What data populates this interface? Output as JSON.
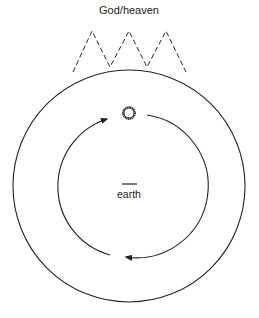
{
  "title_label": "God/heaven",
  "center_label": "earth",
  "colors": {
    "stroke": "#222222",
    "background": "#ffffff"
  },
  "elements": {
    "outer_circle": "heavenly sphere",
    "inner_cycle": "circular arrows (orbit)",
    "sun": "sun-icon",
    "peaks": "dashed zigzag to God/heaven"
  }
}
